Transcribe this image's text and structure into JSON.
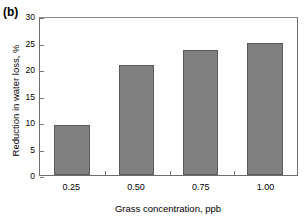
{
  "figure": {
    "panel_label": "(b)"
  },
  "chart_data": {
    "type": "bar",
    "title": "",
    "subtitle": "",
    "xlabel": "Grass concentration, ppb",
    "ylabel": "Reduction in water loss, %",
    "categories": [
      "0.25",
      "0.50",
      "0.75",
      "1.00"
    ],
    "values": [
      9.6,
      21.1,
      23.9,
      25.3
    ],
    "series": [
      {
        "name": "Reduction in water loss",
        "values": [
          9.6,
          21.1,
          23.9,
          25.3
        ]
      }
    ],
    "ylim": [
      0,
      30
    ],
    "ytick_labels": [
      "0",
      "5",
      "10",
      "15",
      "20",
      "25",
      "30"
    ],
    "ytick_values": [
      0,
      5,
      10,
      15,
      20,
      25,
      30
    ],
    "xtick_labels": [
      "0.25",
      "0.50",
      "0.75",
      "1.00"
    ],
    "grid": false,
    "legend": false,
    "legend_position": "none",
    "bar_color": "#808080",
    "bar_edge_color": "#595959",
    "axis_color": "#6e6e6e",
    "background_color": "#ffffff",
    "text_color": "#000000"
  }
}
